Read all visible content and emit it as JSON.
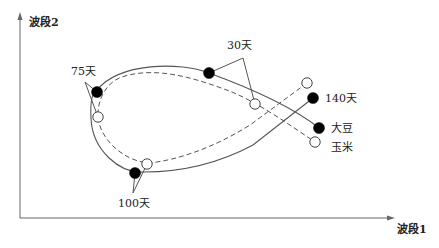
{
  "diagram": {
    "axes": {
      "y_label": "波段2",
      "x_label": "波段1"
    },
    "series": [
      {
        "name": "大豆",
        "marker": "filled-circle",
        "line": "solid"
      },
      {
        "name": "玉米",
        "marker": "hollow-circle",
        "line": "dashed"
      }
    ],
    "time_labels": {
      "t30": "30天",
      "t75": "75天",
      "t100": "100天",
      "t140": "140天"
    },
    "legend": {
      "soybean": "大豆",
      "corn": "玉米"
    },
    "colors": {
      "line": "#555555",
      "marker_fill": "#000000",
      "hollow_fill": "#ffffff"
    }
  }
}
